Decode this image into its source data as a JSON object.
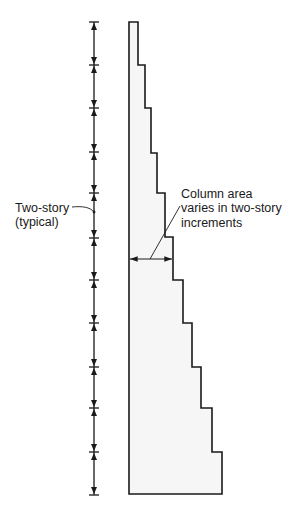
{
  "diagram": {
    "type": "column-section-elevation",
    "colors": {
      "stroke": "#1a1a1a",
      "column_fill": "#f6f6f6",
      "background": "#ffffff"
    },
    "dimension_line": {
      "x": 94,
      "tick_ys": [
        22,
        65,
        108,
        152,
        193,
        238,
        280,
        323,
        367,
        408,
        452,
        495
      ],
      "segment_meaning": "two-story"
    },
    "column_profile": {
      "left_x": 129,
      "top_y": 22,
      "bottom_y": 494,
      "steps": [
        {
          "y_top": 22,
          "y_bottom": 65,
          "right_x": 138
        },
        {
          "y_top": 65,
          "y_bottom": 108,
          "right_x": 145
        },
        {
          "y_top": 108,
          "y_bottom": 153,
          "right_x": 151
        },
        {
          "y_top": 153,
          "y_bottom": 193,
          "right_x": 157
        },
        {
          "y_top": 193,
          "y_bottom": 237,
          "right_x": 165
        },
        {
          "y_top": 237,
          "y_bottom": 280,
          "right_x": 173
        },
        {
          "y_top": 280,
          "y_bottom": 323,
          "right_x": 183
        },
        {
          "y_top": 323,
          "y_bottom": 367,
          "right_x": 192
        },
        {
          "y_top": 367,
          "y_bottom": 408,
          "right_x": 201
        },
        {
          "y_top": 408,
          "y_bottom": 452,
          "right_x": 212
        },
        {
          "y_top": 452,
          "y_bottom": 494,
          "right_x": 222
        }
      ]
    },
    "width_dimension": {
      "y": 259,
      "x1": 129,
      "x2": 173
    }
  },
  "labels": {
    "left_label": {
      "line1": "Two-story",
      "line2": "(typical)"
    },
    "right_label": {
      "line1": "Column area",
      "line2": "varies in two-story",
      "line3": "increments"
    }
  }
}
